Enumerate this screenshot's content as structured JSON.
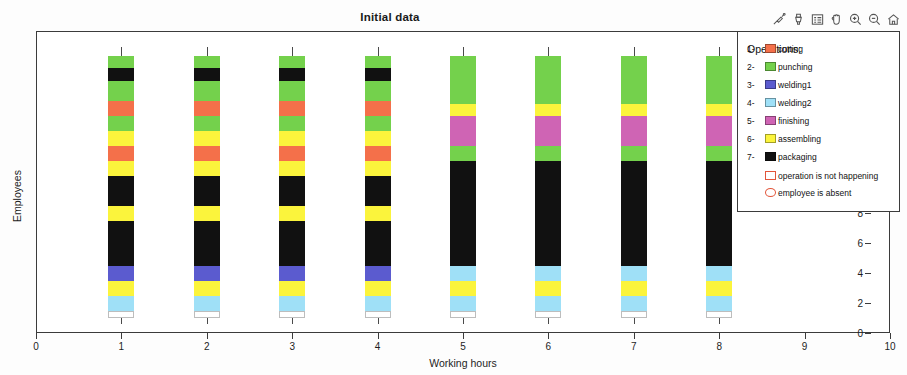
{
  "figure": {
    "title": "Initial data",
    "background": "#ffffff"
  },
  "toolbar": {
    "buttons": [
      {
        "name": "data-cursor-icon",
        "label": "Data Cursor"
      },
      {
        "name": "brush-icon",
        "label": "Brush/Select Data"
      },
      {
        "name": "insert-legend-icon",
        "label": "Insert Legend"
      },
      {
        "name": "pan-hand-icon",
        "label": "Pan"
      },
      {
        "name": "zoom-in-icon",
        "label": "Zoom In"
      },
      {
        "name": "zoom-out-icon",
        "label": "Zoom Out"
      },
      {
        "name": "home-icon",
        "label": "Restore View"
      }
    ]
  },
  "legend": {
    "title": "Operations:",
    "items": [
      {
        "num": "1-",
        "label": "cutting",
        "color": "#f4704a",
        "swatch": "filled"
      },
      {
        "num": "2-",
        "label": "punching",
        "color": "#74d14c",
        "swatch": "filled"
      },
      {
        "num": "3-",
        "label": "welding1",
        "color": "#5b5bcf",
        "swatch": "filled"
      },
      {
        "num": "4-",
        "label": "welding2",
        "color": "#9fe0f7",
        "swatch": "filled"
      },
      {
        "num": "5-",
        "label": "finishing",
        "color": "#cf64b4",
        "swatch": "filled"
      },
      {
        "num": "6-",
        "label": "assembling",
        "color": "#fbf43c",
        "swatch": "filled"
      },
      {
        "num": "7-",
        "label": "packaging",
        "color": "#111111",
        "swatch": "filled"
      },
      {
        "num": "",
        "label": "operation is not happening",
        "color": "#ffffff",
        "swatch": "empty"
      },
      {
        "num": "",
        "label": "employee is absent",
        "color": "#ffffff",
        "swatch": "circle"
      }
    ]
  },
  "chart_data": {
    "type": "bar",
    "title": "Initial data",
    "xlabel": "Working hours",
    "ylabel": "Employees",
    "xlim": [
      0,
      10
    ],
    "ylim": [
      0,
      19
    ],
    "xticks": [
      0,
      1,
      2,
      3,
      4,
      5,
      6,
      7,
      8,
      9,
      10
    ],
    "yticks": [
      0,
      2,
      4,
      6,
      8,
      10,
      12,
      14,
      16,
      18
    ],
    "grid": false,
    "orientation": "vertical-stacked",
    "bar_width": 0.3,
    "legend_position": "right-outside",
    "operation_colors": {
      "cutting": "#f4704a",
      "punching": "#74d14c",
      "welding1": "#5b5bcf",
      "welding2": "#9fe0f7",
      "finishing": "#cf64b4",
      "assembling": "#fbf43c",
      "packaging": "#111111",
      "not_happening": "#ffffff"
    },
    "columns": [
      {
        "x": 1,
        "segments": [
          {
            "from": 1.0,
            "to": 1.5,
            "op": "not_happening"
          },
          {
            "from": 1.5,
            "to": 2.5,
            "op": "welding2"
          },
          {
            "from": 2.5,
            "to": 3.5,
            "op": "assembling"
          },
          {
            "from": 3.5,
            "to": 4.5,
            "op": "welding1"
          },
          {
            "from": 4.5,
            "to": 7.5,
            "op": "packaging"
          },
          {
            "from": 7.5,
            "to": 8.5,
            "op": "assembling"
          },
          {
            "from": 8.5,
            "to": 10.5,
            "op": "packaging"
          },
          {
            "from": 10.5,
            "to": 11.5,
            "op": "assembling"
          },
          {
            "from": 11.5,
            "to": 12.5,
            "op": "cutting"
          },
          {
            "from": 12.5,
            "to": 13.5,
            "op": "assembling"
          },
          {
            "from": 13.5,
            "to": 14.5,
            "op": "punching"
          },
          {
            "from": 14.5,
            "to": 15.5,
            "op": "cutting"
          },
          {
            "from": 15.5,
            "to": 16.8,
            "op": "punching"
          },
          {
            "from": 16.8,
            "to": 17.7,
            "op": "packaging"
          },
          {
            "from": 17.7,
            "to": 18.5,
            "op": "punching"
          }
        ]
      },
      {
        "x": 2,
        "segments": [
          {
            "from": 1.0,
            "to": 1.5,
            "op": "not_happening"
          },
          {
            "from": 1.5,
            "to": 2.5,
            "op": "welding2"
          },
          {
            "from": 2.5,
            "to": 3.5,
            "op": "assembling"
          },
          {
            "from": 3.5,
            "to": 4.5,
            "op": "welding1"
          },
          {
            "from": 4.5,
            "to": 7.5,
            "op": "packaging"
          },
          {
            "from": 7.5,
            "to": 8.5,
            "op": "assembling"
          },
          {
            "from": 8.5,
            "to": 10.5,
            "op": "packaging"
          },
          {
            "from": 10.5,
            "to": 11.5,
            "op": "assembling"
          },
          {
            "from": 11.5,
            "to": 12.5,
            "op": "cutting"
          },
          {
            "from": 12.5,
            "to": 13.5,
            "op": "assembling"
          },
          {
            "from": 13.5,
            "to": 14.5,
            "op": "punching"
          },
          {
            "from": 14.5,
            "to": 15.5,
            "op": "cutting"
          },
          {
            "from": 15.5,
            "to": 16.8,
            "op": "punching"
          },
          {
            "from": 16.8,
            "to": 17.7,
            "op": "packaging"
          },
          {
            "from": 17.7,
            "to": 18.5,
            "op": "punching"
          }
        ]
      },
      {
        "x": 3,
        "segments": [
          {
            "from": 1.0,
            "to": 1.5,
            "op": "not_happening"
          },
          {
            "from": 1.5,
            "to": 2.5,
            "op": "welding2"
          },
          {
            "from": 2.5,
            "to": 3.5,
            "op": "assembling"
          },
          {
            "from": 3.5,
            "to": 4.5,
            "op": "welding1"
          },
          {
            "from": 4.5,
            "to": 7.5,
            "op": "packaging"
          },
          {
            "from": 7.5,
            "to": 8.5,
            "op": "assembling"
          },
          {
            "from": 8.5,
            "to": 10.5,
            "op": "packaging"
          },
          {
            "from": 10.5,
            "to": 11.5,
            "op": "assembling"
          },
          {
            "from": 11.5,
            "to": 12.5,
            "op": "cutting"
          },
          {
            "from": 12.5,
            "to": 13.5,
            "op": "assembling"
          },
          {
            "from": 13.5,
            "to": 14.5,
            "op": "punching"
          },
          {
            "from": 14.5,
            "to": 15.5,
            "op": "cutting"
          },
          {
            "from": 15.5,
            "to": 16.8,
            "op": "punching"
          },
          {
            "from": 16.8,
            "to": 17.7,
            "op": "packaging"
          },
          {
            "from": 17.7,
            "to": 18.5,
            "op": "punching"
          }
        ]
      },
      {
        "x": 4,
        "segments": [
          {
            "from": 1.0,
            "to": 1.5,
            "op": "not_happening"
          },
          {
            "from": 1.5,
            "to": 2.5,
            "op": "welding2"
          },
          {
            "from": 2.5,
            "to": 3.5,
            "op": "assembling"
          },
          {
            "from": 3.5,
            "to": 4.5,
            "op": "welding1"
          },
          {
            "from": 4.5,
            "to": 7.5,
            "op": "packaging"
          },
          {
            "from": 7.5,
            "to": 8.5,
            "op": "assembling"
          },
          {
            "from": 8.5,
            "to": 10.5,
            "op": "packaging"
          },
          {
            "from": 10.5,
            "to": 11.5,
            "op": "assembling"
          },
          {
            "from": 11.5,
            "to": 12.5,
            "op": "cutting"
          },
          {
            "from": 12.5,
            "to": 13.5,
            "op": "assembling"
          },
          {
            "from": 13.5,
            "to": 14.5,
            "op": "punching"
          },
          {
            "from": 14.5,
            "to": 15.5,
            "op": "cutting"
          },
          {
            "from": 15.5,
            "to": 16.8,
            "op": "punching"
          },
          {
            "from": 16.8,
            "to": 17.7,
            "op": "packaging"
          },
          {
            "from": 17.7,
            "to": 18.5,
            "op": "punching"
          }
        ]
      },
      {
        "x": 5,
        "segments": [
          {
            "from": 1.0,
            "to": 1.5,
            "op": "not_happening"
          },
          {
            "from": 1.5,
            "to": 2.5,
            "op": "welding2"
          },
          {
            "from": 2.5,
            "to": 3.5,
            "op": "assembling"
          },
          {
            "from": 3.5,
            "to": 4.5,
            "op": "welding2"
          },
          {
            "from": 4.5,
            "to": 11.5,
            "op": "packaging"
          },
          {
            "from": 11.5,
            "to": 12.5,
            "op": "punching"
          },
          {
            "from": 12.5,
            "to": 14.5,
            "op": "finishing"
          },
          {
            "from": 14.5,
            "to": 15.3,
            "op": "assembling"
          },
          {
            "from": 15.3,
            "to": 18.5,
            "op": "punching"
          }
        ]
      },
      {
        "x": 6,
        "segments": [
          {
            "from": 1.0,
            "to": 1.5,
            "op": "not_happening"
          },
          {
            "from": 1.5,
            "to": 2.5,
            "op": "welding2"
          },
          {
            "from": 2.5,
            "to": 3.5,
            "op": "assembling"
          },
          {
            "from": 3.5,
            "to": 4.5,
            "op": "welding2"
          },
          {
            "from": 4.5,
            "to": 11.5,
            "op": "packaging"
          },
          {
            "from": 11.5,
            "to": 12.5,
            "op": "punching"
          },
          {
            "from": 12.5,
            "to": 14.5,
            "op": "finishing"
          },
          {
            "from": 14.5,
            "to": 15.3,
            "op": "assembling"
          },
          {
            "from": 15.3,
            "to": 18.5,
            "op": "punching"
          }
        ]
      },
      {
        "x": 7,
        "segments": [
          {
            "from": 1.0,
            "to": 1.5,
            "op": "not_happening"
          },
          {
            "from": 1.5,
            "to": 2.5,
            "op": "welding2"
          },
          {
            "from": 2.5,
            "to": 3.5,
            "op": "assembling"
          },
          {
            "from": 3.5,
            "to": 4.5,
            "op": "welding2"
          },
          {
            "from": 4.5,
            "to": 11.5,
            "op": "packaging"
          },
          {
            "from": 11.5,
            "to": 12.5,
            "op": "punching"
          },
          {
            "from": 12.5,
            "to": 14.5,
            "op": "finishing"
          },
          {
            "from": 14.5,
            "to": 15.3,
            "op": "assembling"
          },
          {
            "from": 15.3,
            "to": 18.5,
            "op": "punching"
          }
        ]
      },
      {
        "x": 8,
        "segments": [
          {
            "from": 1.0,
            "to": 1.5,
            "op": "not_happening"
          },
          {
            "from": 1.5,
            "to": 2.5,
            "op": "welding2"
          },
          {
            "from": 2.5,
            "to": 3.5,
            "op": "assembling"
          },
          {
            "from": 3.5,
            "to": 4.5,
            "op": "welding2"
          },
          {
            "from": 4.5,
            "to": 11.5,
            "op": "packaging"
          },
          {
            "from": 11.5,
            "to": 12.5,
            "op": "punching"
          },
          {
            "from": 12.5,
            "to": 14.5,
            "op": "finishing"
          },
          {
            "from": 14.5,
            "to": 15.3,
            "op": "assembling"
          },
          {
            "from": 15.3,
            "to": 18.5,
            "op": "punching"
          }
        ]
      }
    ]
  }
}
